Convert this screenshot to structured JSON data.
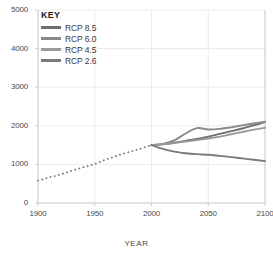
{
  "chart_data": {
    "type": "line",
    "title": "",
    "xlabel": "YEAR",
    "ylabel": "",
    "xlim": [
      1900,
      2100
    ],
    "ylim": [
      0,
      5000
    ],
    "grid": true,
    "legend_position": "top-left",
    "legend_title": "KEY",
    "x_ticks": [
      "1900",
      "1950",
      "2000",
      "2050",
      "2100"
    ],
    "y_ticks": [
      "0",
      "1000",
      "2000",
      "3000",
      "4000",
      "5000"
    ],
    "historical": {
      "name": "Historical",
      "style": "dotted",
      "color": "#777777",
      "x": [
        1900,
        1905,
        1910,
        1915,
        1920,
        1925,
        1930,
        1935,
        1940,
        1945,
        1950,
        1955,
        1960,
        1965,
        1970,
        1975,
        1980,
        1985,
        1990,
        1995,
        2000
      ],
      "values": [
        580,
        620,
        665,
        700,
        745,
        790,
        840,
        880,
        930,
        965,
        1010,
        1070,
        1130,
        1175,
        1230,
        1275,
        1320,
        1360,
        1405,
        1455,
        1500
      ]
    },
    "series": [
      {
        "name": "RCP 8.5",
        "color": "#6e6e6e",
        "x": [
          2000,
          2010,
          2020,
          2030,
          2040,
          2050,
          2060,
          2070,
          2080,
          2090,
          2100
        ],
        "values": [
          1500,
          1520,
          1560,
          1610,
          1660,
          1720,
          1790,
          1860,
          1930,
          2010,
          2100
        ]
      },
      {
        "name": "RCP 6.0",
        "color": "#8a8a8a",
        "x": [
          2000,
          2010,
          2020,
          2030,
          2040,
          2050,
          2060,
          2070,
          2080,
          2090,
          2100
        ],
        "values": [
          1500,
          1530,
          1620,
          1800,
          1940,
          1905,
          1920,
          1960,
          2010,
          2060,
          2105
        ]
      },
      {
        "name": "RCP 4.5",
        "color": "#9a9a9a",
        "x": [
          2000,
          2010,
          2020,
          2030,
          2040,
          2050,
          2060,
          2070,
          2080,
          2090,
          2100
        ],
        "values": [
          1500,
          1520,
          1550,
          1590,
          1630,
          1670,
          1720,
          1780,
          1840,
          1900,
          1950
        ]
      },
      {
        "name": "RCP 2.6",
        "color": "#7a7a7a",
        "x": [
          2000,
          2010,
          2020,
          2030,
          2040,
          2050,
          2060,
          2070,
          2080,
          2090,
          2100
        ],
        "values": [
          1500,
          1400,
          1330,
          1290,
          1265,
          1250,
          1220,
          1190,
          1155,
          1120,
          1085
        ]
      }
    ]
  },
  "axes": {
    "x_title": "YEAR"
  },
  "colors": {
    "grid": "#ebebeb",
    "axis": "#cfcfcf",
    "text": "#4a4a4a"
  }
}
